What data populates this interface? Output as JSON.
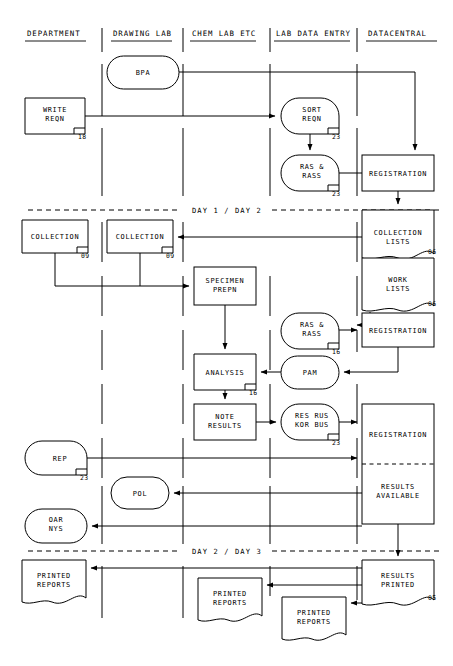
{
  "diagram": {
    "width": 453,
    "height": 666,
    "ink_color": "#000000",
    "paper_color": "#ffffff"
  },
  "lanes": [
    {
      "id": "department",
      "label": "DEPARTMENT",
      "x": 52,
      "divider_x": 102
    },
    {
      "id": "drawing-lab",
      "label": "DRAWING LAB",
      "x": 143,
      "divider_x": 183
    },
    {
      "id": "chem-lab",
      "label": "CHEM LAB ETC",
      "x": 226,
      "divider_x": 270
    },
    {
      "id": "lab-data-entry",
      "label": "LAB DATA ENTRY",
      "x": 314,
      "divider_x": 357
    },
    {
      "id": "datacentral",
      "label": "DATACENTRAL",
      "x": 406,
      "divider_x": null
    }
  ],
  "phase_dividers": [
    {
      "id": "day1-day2",
      "label": "DAY 1 / DAY 2",
      "y": 210
    },
    {
      "id": "day2-day3",
      "label": "DAY 2 / DAY 3",
      "y": 551
    }
  ],
  "nodes": [
    {
      "id": "bpa",
      "label": "BPA",
      "shape": "stadium",
      "lane": "drawing-lab",
      "number": "",
      "x": 107,
      "y": 56,
      "w": 72,
      "h": 33
    },
    {
      "id": "write-reqn",
      "label": "WRITE\nREQN",
      "shape": "process",
      "lane": "department",
      "number": "18",
      "x": 25,
      "y": 98,
      "w": 60,
      "h": 36
    },
    {
      "id": "sort-reqn",
      "label": "SORT\nREQN",
      "shape": "stadium",
      "lane": "lab-data-entry",
      "number": "23",
      "x": 281,
      "y": 98,
      "w": 58,
      "h": 36
    },
    {
      "id": "ras-rass-1",
      "label": "RAS &\nRASS",
      "shape": "stadium",
      "lane": "lab-data-entry",
      "number": "23",
      "x": 281,
      "y": 155,
      "w": 58,
      "h": 36
    },
    {
      "id": "registration-1",
      "label": "REGISTRATION",
      "shape": "process",
      "lane": "datacentral",
      "number": "",
      "x": 362,
      "y": 155,
      "w": 72,
      "h": 36
    },
    {
      "id": "collection-dept",
      "label": "COLLECTION",
      "shape": "process",
      "lane": "department",
      "number": "09",
      "x": 22,
      "y": 220,
      "w": 66,
      "h": 33
    },
    {
      "id": "collection-draw",
      "label": "COLLECTION",
      "shape": "process",
      "lane": "drawing-lab",
      "number": "09",
      "x": 107,
      "y": 220,
      "w": 66,
      "h": 33
    },
    {
      "id": "collection-lists",
      "label": "COLLECTION\nLISTS",
      "shape": "document",
      "lane": "datacentral",
      "number": "06",
      "x": 362,
      "y": 208,
      "w": 72,
      "h": 52
    },
    {
      "id": "work-lists",
      "label": "WORK\nLISTS",
      "shape": "document",
      "lane": "datacentral",
      "number": "06",
      "x": 362,
      "y": 260,
      "w": 72,
      "h": 52
    },
    {
      "id": "specimen-prepn",
      "label": "SPECIMEN\nPREPN",
      "shape": "process",
      "lane": "chem-lab",
      "number": "",
      "x": 194,
      "y": 267,
      "w": 62,
      "h": 38
    },
    {
      "id": "ras-rass-2",
      "label": "RAS &\nRASS",
      "shape": "stadium",
      "lane": "lab-data-entry",
      "number": "16",
      "x": 281,
      "y": 313,
      "w": 58,
      "h": 36
    },
    {
      "id": "registration-2",
      "label": "REGISTRATION",
      "shape": "process",
      "lane": "datacentral",
      "number": "",
      "x": 362,
      "y": 313,
      "w": 72,
      "h": 34
    },
    {
      "id": "analysis",
      "label": "ANALYSIS",
      "shape": "process",
      "lane": "chem-lab",
      "number": "16",
      "x": 194,
      "y": 354,
      "w": 62,
      "h": 36
    },
    {
      "id": "pam",
      "label": "PAM",
      "shape": "stadium",
      "lane": "lab-data-entry",
      "number": "",
      "x": 281,
      "y": 356,
      "w": 58,
      "h": 33
    },
    {
      "id": "note-results",
      "label": "NOTE\nRESULTS",
      "shape": "process",
      "lane": "chem-lab",
      "number": "",
      "x": 194,
      "y": 404,
      "w": 62,
      "h": 36
    },
    {
      "id": "res-rus-kor-bus",
      "label": "RES RUS\nKOR BUS",
      "shape": "stadium",
      "lane": "lab-data-entry",
      "number": "23",
      "x": 281,
      "y": 404,
      "w": 58,
      "h": 36
    },
    {
      "id": "registration-3",
      "label": "REGISTRATION",
      "shape": "process",
      "lane": "datacentral",
      "number": "",
      "x": 362,
      "y": 404,
      "w": 72,
      "h": 60
    },
    {
      "id": "results-available",
      "label": "RESULTS\nAVAILABLE",
      "shape": "process",
      "lane": "datacentral",
      "number": "",
      "x": 362,
      "y": 464,
      "w": 72,
      "h": 60
    },
    {
      "id": "rep",
      "label": "REP",
      "shape": "stadium",
      "lane": "department",
      "number": "23",
      "x": 25,
      "y": 441,
      "w": 62,
      "h": 34
    },
    {
      "id": "pol",
      "label": "POL",
      "shape": "stadium",
      "lane": "drawing-lab",
      "number": "",
      "x": 111,
      "y": 477,
      "w": 58,
      "h": 32
    },
    {
      "id": "oar-nys",
      "label": "OAR\nNYS",
      "shape": "stadium",
      "lane": "department",
      "number": "",
      "x": 25,
      "y": 509,
      "w": 62,
      "h": 34
    },
    {
      "id": "results-printed",
      "label": "RESULTS\nPRINTED",
      "shape": "document",
      "lane": "datacentral",
      "number": "05",
      "x": 362,
      "y": 560,
      "w": 72,
      "h": 46
    },
    {
      "id": "printed-reports-1",
      "label": "PRINTED\nREPORTS",
      "shape": "document",
      "lane": "department",
      "number": "",
      "x": 22,
      "y": 560,
      "w": 64,
      "h": 44
    },
    {
      "id": "printed-reports-2",
      "label": "PRINTED\nREPORTS",
      "shape": "document",
      "lane": "chem-lab",
      "number": "",
      "x": 198,
      "y": 578,
      "w": 64,
      "h": 44
    },
    {
      "id": "printed-reports-3",
      "label": "PRINTED\nREPORTS",
      "shape": "document",
      "lane": "lab-data-entry",
      "number": "",
      "x": 282,
      "y": 597,
      "w": 64,
      "h": 44
    }
  ],
  "connections": [
    {
      "id": "bpa-to-registration-1",
      "from": "bpa",
      "to": "registration-1"
    },
    {
      "id": "write-reqn-to-sort-reqn",
      "from": "write-reqn",
      "to": "sort-reqn"
    },
    {
      "id": "sort-reqn-to-ras-rass-1",
      "from": "sort-reqn",
      "to": "ras-rass-1"
    },
    {
      "id": "ras-rass-1-to-registration-1",
      "from": "ras-rass-1",
      "to": "registration-1"
    },
    {
      "id": "registration-1-to-collection-lists",
      "from": "registration-1",
      "to": "collection-lists"
    },
    {
      "id": "collection-lists-to-collection",
      "from": "collection-lists",
      "to": "collection-draw"
    },
    {
      "id": "collections-to-specimen-prepn",
      "from": "collection-dept",
      "to": "specimen-prepn"
    },
    {
      "id": "work-lists-to-registration-2",
      "from": "work-lists",
      "to": "registration-2"
    },
    {
      "id": "ras-rass-2-to-registration-2",
      "from": "ras-rass-2",
      "to": "registration-2"
    },
    {
      "id": "specimen-prepn-to-analysis",
      "from": "specimen-prepn",
      "to": "analysis"
    },
    {
      "id": "registration-2-to-pam",
      "from": "registration-2",
      "to": "pam"
    },
    {
      "id": "pam-to-analysis",
      "from": "pam",
      "to": "analysis"
    },
    {
      "id": "analysis-to-note-results",
      "from": "analysis",
      "to": "note-results"
    },
    {
      "id": "note-results-to-res-rus",
      "from": "note-results",
      "to": "res-rus-kor-bus"
    },
    {
      "id": "res-rus-to-registration-3",
      "from": "res-rus-kor-bus",
      "to": "registration-3"
    },
    {
      "id": "rep-to-registration-3",
      "from": "rep",
      "to": "registration-3"
    },
    {
      "id": "results-available-to-pol",
      "from": "results-available",
      "to": "pol"
    },
    {
      "id": "results-available-to-oar-nys",
      "from": "results-available",
      "to": "oar-nys"
    },
    {
      "id": "results-available-to-printed",
      "from": "results-available",
      "to": "results-printed"
    },
    {
      "id": "results-printed-to-reports-1",
      "from": "results-printed",
      "to": "printed-reports-1"
    },
    {
      "id": "results-printed-to-reports-2",
      "from": "results-printed",
      "to": "printed-reports-2"
    },
    {
      "id": "results-printed-to-reports-3",
      "from": "results-printed",
      "to": "printed-reports-3"
    }
  ]
}
